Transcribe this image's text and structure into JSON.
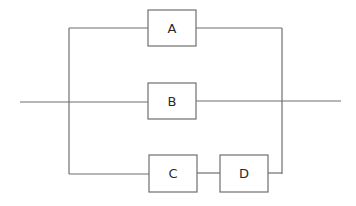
{
  "diagram": {
    "type": "reliability-block-diagram",
    "colors": {
      "line": "#6f6f6f",
      "text": "#2a2a2a",
      "background": "#ffffff"
    },
    "blocks": [
      {
        "id": "A",
        "label": "A"
      },
      {
        "id": "B",
        "label": "B"
      },
      {
        "id": "C",
        "label": "C"
      },
      {
        "id": "D",
        "label": "D"
      }
    ],
    "branches": [
      {
        "name": "top",
        "blocks": [
          "A"
        ]
      },
      {
        "name": "middle",
        "blocks": [
          "B"
        ]
      },
      {
        "name": "bottom",
        "blocks": [
          "C",
          "D"
        ]
      }
    ]
  }
}
